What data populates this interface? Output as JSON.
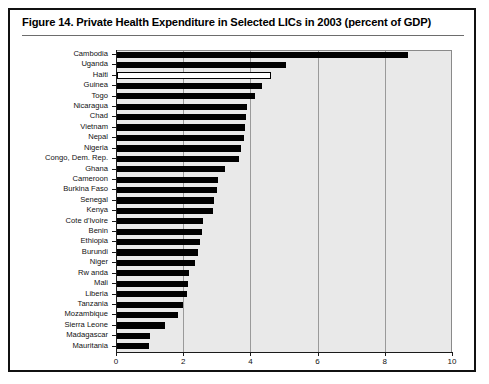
{
  "figure": {
    "title": "Figure 14.  Private Health Expenditure in Selected LICs in 2003 (percent of GDP)",
    "frame_color": "#111111"
  },
  "chart_data": {
    "type": "bar",
    "orientation": "horizontal",
    "title": "Figure 14.  Private Health Expenditure in Selected LICs in 2003 (percent of GDP)",
    "xlabel": "",
    "ylabel": "",
    "xlim": [
      0,
      10
    ],
    "ylim": null,
    "grid": true,
    "legend": null,
    "xticks": [
      "0",
      "2",
      "4",
      "6",
      "8",
      "10"
    ],
    "xtick_values": [
      0,
      2,
      4,
      6,
      8,
      10
    ],
    "bar_color": "#000000",
    "highlight_color": "#ffffff",
    "plot_background": "#e9e9e9",
    "categories": [
      "Cambodia",
      "Uganda",
      "Haiti",
      "Guinea",
      "Togo",
      "Nicaragua",
      "Chad",
      "Vietnam",
      "Nepal",
      "Nigeria",
      "Congo, Dem. Rep.",
      "Ghana",
      "Cameroon",
      "Burkina Faso",
      "Senegal",
      "Kenya",
      "Cote d'Ivoire",
      "Benin",
      "Ethiopia",
      "Burundi",
      "Niger",
      "Rw anda",
      "Mali",
      "Liberia",
      "Tanzania",
      "Mozambique",
      "Sierra Leone",
      "Madagascar",
      "Mauritania"
    ],
    "values": [
      8.7,
      5.05,
      4.6,
      4.35,
      4.15,
      3.9,
      3.87,
      3.85,
      3.82,
      3.72,
      3.67,
      3.25,
      3.05,
      3.0,
      2.93,
      2.9,
      2.6,
      2.55,
      2.5,
      2.45,
      2.35,
      2.18,
      2.15,
      2.1,
      2.0,
      1.85,
      1.45,
      1.0,
      0.98
    ],
    "highlighted_categories": [
      "Haiti"
    ]
  }
}
